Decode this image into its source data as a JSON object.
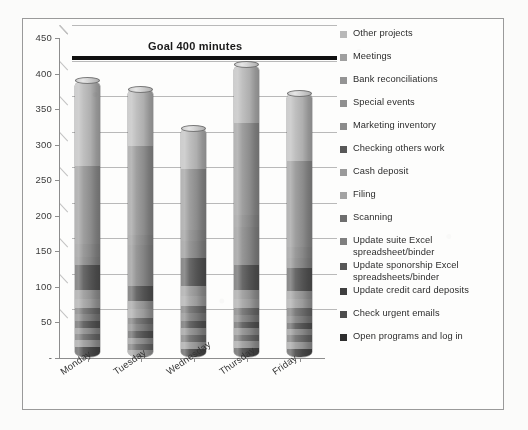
{
  "chart_data": {
    "type": "bar",
    "title": "",
    "subtype": "stacked-cylinder-3d",
    "xlabel": "",
    "ylabel": "",
    "ylim": [
      0,
      450
    ],
    "ytick_step": 50,
    "yticks": [
      "450",
      "400",
      "350",
      "300",
      "250",
      "200",
      "150",
      "100",
      "50",
      "-"
    ],
    "grid": true,
    "legend_position": "right",
    "categories": [
      "Monday",
      "Tuesday",
      "Wednesday",
      "Thursday",
      "Friday"
    ],
    "totals": [
      390,
      378,
      323,
      412,
      372
    ],
    "goal": {
      "label": "Goal 400 minutes",
      "value": 415,
      "color": "#101010"
    },
    "series": [
      {
        "name": "Open programs and log in",
        "color": "#4a4a4a",
        "values": [
          14,
          12,
          12,
          13,
          12
        ]
      },
      {
        "name": "Check urgent emails",
        "color": "#9b9b9b",
        "values": [
          10,
          9,
          10,
          10,
          10
        ]
      },
      {
        "name": "Update daily cash roll forward",
        "color": "#6b6b6b",
        "values": [
          9,
          8,
          10,
          9,
          9
        ]
      },
      {
        "name": "Update credit card deposits",
        "color": "#8e8e8e",
        "values": [
          9,
          9,
          9,
          9,
          9
        ]
      },
      {
        "name": "Update sponorship Excel spreadsheets/binder",
        "color": "#575757",
        "values": [
          9,
          9,
          10,
          9,
          9
        ]
      },
      {
        "name": "Update suite Excel spreadsheet/binder",
        "color": "#7f7f7f",
        "values": [
          10,
          10,
          11,
          10,
          10
        ]
      },
      {
        "name": "Scanning",
        "color": "#6e6e6e",
        "values": [
          9,
          9,
          11,
          10,
          10
        ]
      },
      {
        "name": "Filing",
        "color": "#a3a3a3",
        "values": [
          13,
          12,
          14,
          13,
          13
        ]
      },
      {
        "name": "Cash deposit",
        "color": "#9a9a9a",
        "values": [
          12,
          11,
          13,
          12,
          12
        ]
      },
      {
        "name": "Checking others work",
        "color": "#585858",
        "values": [
          35,
          22,
          40,
          35,
          32
        ]
      },
      {
        "name": "Marketing inventory",
        "color": "#8b8b8b",
        "values": [
          12,
          58,
          24,
          54,
          14
        ]
      },
      {
        "name": "Special events",
        "color": "#8f8f8f",
        "values": [
          18,
          14,
          16,
          16,
          15
        ]
      },
      {
        "name": "Bank reconciliations",
        "color": "#949494",
        "values": [
          110,
          125,
          85,
          130,
          122
        ]
      },
      {
        "name": "Other projects",
        "color": "#b8b8b8",
        "values": [
          120,
          80,
          58,
          82,
          95
        ]
      }
    ]
  },
  "legend": {
    "items": [
      {
        "label": "Other projects",
        "color": "#b8b8b8"
      },
      {
        "label": "Meetings",
        "color": "#9f9f9f"
      },
      {
        "label": "Bank reconciliations",
        "color": "#949494"
      },
      {
        "label": "Special events",
        "color": "#8f8f8f"
      },
      {
        "label": "Marketing inventory",
        "color": "#8b8b8b"
      },
      {
        "label": "Checking others work",
        "color": "#585858"
      },
      {
        "label": "Cash deposit",
        "color": "#9a9a9a"
      },
      {
        "label": "Filing",
        "color": "#a3a3a3"
      },
      {
        "label": "Scanning",
        "color": "#6e6e6e"
      },
      {
        "label": "Update suite Excel spreadsheet/binder",
        "color": "#7f7f7f"
      },
      {
        "label": "Update sponorship Excel spreadsheets/binder",
        "color": "#575757"
      },
      {
        "label": "Update credit card deposits",
        "color": "#3f3f3f"
      },
      {
        "label": "Check urgent emails",
        "color": "#4d4d4d"
      },
      {
        "label": "Open programs and log in",
        "color": "#2e2e2e"
      }
    ]
  }
}
